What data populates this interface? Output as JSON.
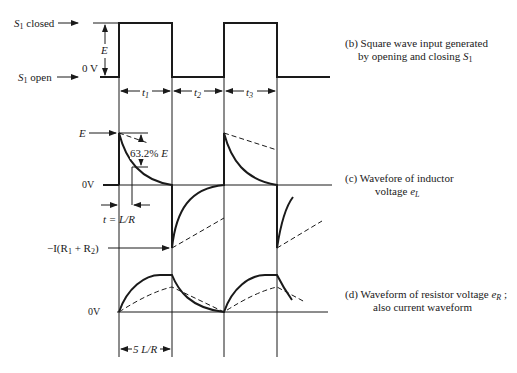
{
  "panel_b": {
    "labels": {
      "s1_closed_prefix": "S",
      "s1_closed_sub": "1",
      "s1_closed_suffix": " closed",
      "s1_open_prefix": "S",
      "s1_open_sub": "1",
      "s1_open_suffix": " open",
      "amplitude": "E",
      "zero": "0 V"
    },
    "intervals": [
      {
        "sym": "t",
        "sub": "1"
      },
      {
        "sym": "t",
        "sub": "2"
      },
      {
        "sym": "t",
        "sub": "3"
      }
    ],
    "caption": {
      "line1": "(b) Square wave input generated",
      "line2_prefix": "by opening and closing ",
      "line2_sym": "S",
      "line2_sub": "1"
    }
  },
  "panel_c": {
    "labels": {
      "E": "E",
      "percent": "63.2% ",
      "percent_sym": "E",
      "zero": "0V",
      "tau": "t = L/R",
      "neg_prefix": "−I(R",
      "neg_sub1": "1",
      "neg_mid": " + R",
      "neg_sub2": "2",
      "neg_suffix": ")"
    },
    "caption": {
      "line1": "(c) Wavefore of inductor",
      "line2_prefix": "voltage ",
      "line2_sym": "e",
      "line2_sub": "L"
    }
  },
  "panel_d": {
    "labels": {
      "zero": "0V",
      "five_tau": "5 L/R"
    },
    "caption": {
      "line1_prefix": "(d) Waveform of resistor voltage ",
      "line1_sym": "e",
      "line1_sub": "R",
      "line1_suffix": " ;",
      "line2": "also current waveform"
    }
  }
}
